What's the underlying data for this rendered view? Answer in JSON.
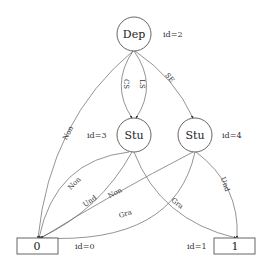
{
  "nodes": [
    {
      "key": "dep",
      "label": "Dep",
      "id_label": "id=2",
      "shape": "circle"
    },
    {
      "key": "stu3",
      "label": "Stu",
      "id_label": "id=3",
      "shape": "circle"
    },
    {
      "key": "stu4",
      "label": "Stu",
      "id_label": "id=4",
      "shape": "circle"
    },
    {
      "key": "leaf0",
      "label": "0",
      "id_label": "id=0",
      "shape": "box"
    },
    {
      "key": "leaf1",
      "label": "1",
      "id_label": "id=1",
      "shape": "box"
    }
  ],
  "edges": [
    {
      "from": "dep",
      "to": "leaf0",
      "label": "Non"
    },
    {
      "from": "dep",
      "to": "stu3",
      "label": "CS"
    },
    {
      "from": "dep",
      "to": "stu3",
      "label": "LS"
    },
    {
      "from": "dep",
      "to": "stu4",
      "label": "SE"
    },
    {
      "from": "stu3",
      "to": "leaf0",
      "label": "Non"
    },
    {
      "from": "stu3",
      "to": "leaf0",
      "label": "Und"
    },
    {
      "from": "stu3",
      "to": "leaf1",
      "label": "Gra"
    },
    {
      "from": "stu4",
      "to": "leaf0",
      "label": "Non"
    },
    {
      "from": "stu4",
      "to": "leaf0",
      "label": "Gra"
    },
    {
      "from": "stu4",
      "to": "leaf1",
      "label": "Und"
    }
  ]
}
